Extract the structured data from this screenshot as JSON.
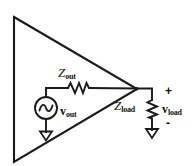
{
  "diagram": {
    "type": "circuit-schematic",
    "stroke_color": "#1a1a1a",
    "background_color": "#ffffff",
    "elements": {
      "amplifier": {
        "name": "amplifier-triangle",
        "shape": "triangle",
        "vertices": [
          [
            14,
            17
          ],
          [
            137,
            89
          ],
          [
            14,
            162
          ]
        ]
      },
      "source": {
        "name": "ac-voltage-source",
        "symbol": "sine-wave-in-circle",
        "center": [
          46,
          108
        ],
        "radius": 11
      },
      "series_resistor": {
        "name": "output-impedance-resistor",
        "symbol": "zigzag-resistor",
        "orientation": "horizontal"
      },
      "load_resistor": {
        "name": "load-impedance-resistor",
        "symbol": "zigzag-resistor",
        "orientation": "vertical"
      },
      "grounds": [
        {
          "name": "ground-source",
          "symbol": "ground-triangle",
          "at": [
            46,
            133
          ]
        },
        {
          "name": "ground-load",
          "symbol": "ground-triangle",
          "at": [
            152,
            130
          ]
        }
      ]
    },
    "labels": {
      "z_out": {
        "base": "Z",
        "sub": "out"
      },
      "v_out": {
        "base": "v",
        "sub": "out"
      },
      "z_load": {
        "base": "Z",
        "sub": "load"
      },
      "v_load": {
        "base": "v",
        "sub": "load"
      },
      "polarity_plus": "+",
      "polarity_minus": "-"
    }
  }
}
